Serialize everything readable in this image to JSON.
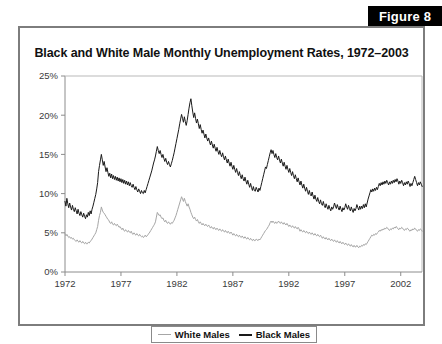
{
  "figure": {
    "badge_label": "Figure 8"
  },
  "chart_title": "Black and White Male Monthly Unemployment Rates, 1972–2003",
  "legend": {
    "items": [
      {
        "label": "White Males",
        "color": "#a6a6a6"
      },
      {
        "label": "Black Males",
        "color": "#1a1a1a"
      }
    ]
  },
  "axes": {
    "y_ticks": [
      "0%",
      "5%",
      "10%",
      "15%",
      "20%",
      "25%"
    ],
    "x_ticks": [
      "1972",
      "1977",
      "1982",
      "1987",
      "1992",
      "1997",
      "2002"
    ]
  },
  "chart_data": {
    "type": "line",
    "title": "Black and White Male Monthly Unemployment Rates, 1972–2003",
    "xlabel": "",
    "ylabel": "",
    "xlim": [
      1972,
      2003.9
    ],
    "ylim": [
      0,
      25
    ],
    "y_unit": "percent",
    "grid": false,
    "legend_position": "bottom",
    "x_tick_values": [
      1972,
      1977,
      1982,
      1987,
      1992,
      1997,
      2002
    ],
    "y_tick_values": [
      0,
      5,
      10,
      15,
      20,
      25
    ],
    "x_start": 1972.0,
    "x_step_years": 0.08333,
    "annotations": [
      "Black male rate peaks near 22% in late 1982/early 1983",
      "White male rate peaks near 10% in late 1982",
      "Both series trough near 1999-2000 and rise through 2003"
    ],
    "series": [
      {
        "name": "White Males",
        "color": "#a6a6a6",
        "values": [
          4.9,
          4.6,
          4.8,
          4.6,
          4.4,
          4.5,
          4.3,
          4.4,
          4.2,
          4.3,
          4.1,
          4.0,
          3.9,
          4.1,
          3.9,
          3.8,
          4.0,
          3.8,
          3.7,
          3.9,
          3.7,
          3.6,
          3.8,
          3.6,
          3.6,
          3.8,
          3.7,
          3.9,
          4.0,
          4.2,
          4.4,
          4.6,
          4.8,
          5.0,
          5.4,
          5.8,
          6.6,
          7.2,
          7.6,
          8.3,
          7.9,
          7.6,
          7.5,
          7.3,
          7.1,
          6.9,
          6.7,
          6.6,
          6.3,
          6.2,
          6.4,
          6.1,
          6.0,
          6.2,
          6.0,
          5.9,
          6.1,
          5.9,
          5.7,
          5.8,
          5.6,
          5.4,
          5.6,
          5.3,
          5.2,
          5.4,
          5.2,
          5.1,
          5.3,
          5.1,
          5.0,
          5.2,
          4.9,
          4.8,
          5.0,
          4.8,
          4.7,
          4.9,
          4.7,
          4.6,
          4.8,
          4.6,
          4.5,
          4.6,
          4.4,
          4.5,
          4.7,
          4.5,
          4.6,
          4.8,
          4.9,
          5.1,
          5.3,
          5.5,
          5.7,
          5.9,
          6.1,
          6.4,
          7.0,
          7.6,
          7.4,
          7.2,
          7.3,
          7.0,
          6.8,
          6.9,
          6.6,
          6.4,
          6.6,
          6.3,
          6.2,
          6.4,
          6.2,
          6.1,
          6.3,
          6.2,
          6.4,
          6.6,
          6.9,
          7.2,
          7.6,
          8.0,
          8.4,
          8.8,
          9.2,
          9.6,
          9.3,
          9.0,
          9.4,
          9.0,
          8.7,
          8.4,
          8.7,
          8.3,
          8.0,
          7.6,
          7.3,
          7.0,
          6.8,
          7.0,
          6.7,
          6.5,
          6.7,
          6.4,
          6.2,
          6.4,
          6.2,
          6.0,
          6.2,
          6.0,
          5.9,
          6.1,
          5.9,
          5.8,
          6.0,
          5.8,
          5.6,
          5.8,
          5.6,
          5.5,
          5.7,
          5.5,
          5.4,
          5.6,
          5.4,
          5.3,
          5.5,
          5.3,
          5.2,
          5.4,
          5.2,
          5.1,
          5.3,
          5.1,
          5.0,
          5.2,
          5.0,
          4.9,
          5.1,
          4.9,
          4.7,
          4.9,
          4.7,
          4.6,
          4.8,
          4.6,
          4.5,
          4.7,
          4.5,
          4.4,
          4.6,
          4.4,
          4.3,
          4.5,
          4.3,
          4.2,
          4.4,
          4.2,
          4.1,
          4.3,
          4.1,
          4.0,
          4.2,
          4.0,
          4.0,
          4.2,
          4.1,
          4.0,
          4.2,
          4.1,
          4.3,
          4.5,
          4.7,
          4.9,
          5.1,
          5.3,
          5.4,
          5.6,
          5.8,
          6.0,
          6.3,
          6.5,
          6.3,
          6.5,
          6.3,
          6.2,
          6.4,
          6.2,
          6.3,
          6.5,
          6.3,
          6.2,
          6.4,
          6.2,
          6.1,
          6.3,
          6.1,
          6.0,
          6.2,
          6.0,
          5.8,
          6.0,
          5.8,
          5.7,
          5.9,
          5.7,
          5.6,
          5.8,
          5.6,
          5.5,
          5.7,
          5.5,
          5.2,
          5.4,
          5.2,
          5.1,
          5.3,
          5.1,
          5.0,
          5.2,
          5.0,
          4.9,
          5.1,
          4.9,
          4.8,
          5.0,
          4.8,
          4.7,
          4.9,
          4.7,
          4.6,
          4.8,
          4.6,
          4.5,
          4.7,
          4.5,
          4.3,
          4.5,
          4.3,
          4.2,
          4.4,
          4.2,
          4.1,
          4.3,
          4.1,
          4.0,
          4.2,
          4.0,
          3.9,
          4.1,
          3.9,
          3.8,
          4.0,
          3.8,
          3.7,
          3.9,
          3.7,
          3.6,
          3.8,
          3.6,
          3.5,
          3.7,
          3.5,
          3.4,
          3.6,
          3.4,
          3.3,
          3.5,
          3.3,
          3.2,
          3.4,
          3.2,
          3.2,
          3.4,
          3.2,
          3.1,
          3.3,
          3.2,
          3.4,
          3.3,
          3.5,
          3.4,
          3.6,
          3.5,
          3.7,
          3.9,
          4.1,
          4.3,
          4.5,
          4.7,
          4.6,
          4.8,
          4.7,
          4.9,
          4.8,
          5.0,
          5.1,
          5.3,
          5.2,
          5.4,
          5.3,
          5.5,
          5.4,
          5.6,
          5.5,
          5.7,
          5.6,
          5.4,
          5.3,
          5.5,
          5.4,
          5.6,
          5.5,
          5.7,
          5.6,
          5.8,
          5.7,
          5.5,
          5.4,
          5.6,
          5.5,
          5.7,
          5.6,
          5.4,
          5.3,
          5.5,
          5.4,
          5.6,
          5.5,
          5.3,
          5.2,
          5.4,
          5.3,
          5.5,
          5.4,
          5.6,
          5.5,
          5.3,
          5.2,
          5.4,
          5.3,
          5.5,
          5.4,
          5.2
        ]
      },
      {
        "name": "Black Males",
        "color": "#1a1a1a",
        "values": [
          9.0,
          8.4,
          9.4,
          8.7,
          8.2,
          8.8,
          8.3,
          7.9,
          8.5,
          8.0,
          7.7,
          8.2,
          7.8,
          7.4,
          8.0,
          7.5,
          7.2,
          7.7,
          7.3,
          7.0,
          7.5,
          7.1,
          6.8,
          7.3,
          7.0,
          7.6,
          7.2,
          7.8,
          7.4,
          8.0,
          8.4,
          8.9,
          9.4,
          9.9,
          10.6,
          11.4,
          12.8,
          13.6,
          14.3,
          15.0,
          14.3,
          13.6,
          14.1,
          13.4,
          12.8,
          13.3,
          12.7,
          12.2,
          12.6,
          12.0,
          12.5,
          11.9,
          12.3,
          11.8,
          12.2,
          11.7,
          12.1,
          11.6,
          12.0,
          11.5,
          11.9,
          11.4,
          11.8,
          11.3,
          11.7,
          11.2,
          11.6,
          11.1,
          11.5,
          11.0,
          11.4,
          11.0,
          10.8,
          11.2,
          10.8,
          10.5,
          10.9,
          10.5,
          10.2,
          10.6,
          10.3,
          10.0,
          10.4,
          10.1,
          10.0,
          10.4,
          10.1,
          10.5,
          10.9,
          11.3,
          11.7,
          12.1,
          12.5,
          12.9,
          13.4,
          13.9,
          14.3,
          14.8,
          15.4,
          16.0,
          15.5,
          15.1,
          15.5,
          15.0,
          14.6,
          15.0,
          14.5,
          14.1,
          14.5,
          14.0,
          13.7,
          14.1,
          13.7,
          13.4,
          13.8,
          14.2,
          14.7,
          15.2,
          15.8,
          16.4,
          17.0,
          17.6,
          18.2,
          18.9,
          19.5,
          20.1,
          19.6,
          19.1,
          19.8,
          19.2,
          18.7,
          19.3,
          20.1,
          20.9,
          21.6,
          22.1,
          21.2,
          20.4,
          19.7,
          20.3,
          19.6,
          19.0,
          19.5,
          18.9,
          18.3,
          18.8,
          18.2,
          17.7,
          18.1,
          17.6,
          17.1,
          17.6,
          17.1,
          16.7,
          17.1,
          16.6,
          16.2,
          16.7,
          16.2,
          15.8,
          16.3,
          15.8,
          15.4,
          15.9,
          15.4,
          15.0,
          15.5,
          15.0,
          14.7,
          15.2,
          14.7,
          14.3,
          14.8,
          14.3,
          13.9,
          14.4,
          13.9,
          13.5,
          14.0,
          13.5,
          13.1,
          13.6,
          13.1,
          12.7,
          13.2,
          12.7,
          12.3,
          12.8,
          12.3,
          11.9,
          12.4,
          11.9,
          11.6,
          12.1,
          11.6,
          11.2,
          11.7,
          11.2,
          10.8,
          11.3,
          10.8,
          10.4,
          10.9,
          10.4,
          10.3,
          10.8,
          10.5,
          10.2,
          10.7,
          10.4,
          10.9,
          11.4,
          11.9,
          12.4,
          12.9,
          13.4,
          13.2,
          13.7,
          14.2,
          14.7,
          15.2,
          15.6,
          15.1,
          15.5,
          15.0,
          14.6,
          15.1,
          14.6,
          14.3,
          14.8,
          14.3,
          13.9,
          14.4,
          13.9,
          13.5,
          14.0,
          13.5,
          13.1,
          13.6,
          13.1,
          12.7,
          13.2,
          12.7,
          12.3,
          12.8,
          12.3,
          11.9,
          12.4,
          11.9,
          11.5,
          12.0,
          11.5,
          11.1,
          11.6,
          11.1,
          10.7,
          11.2,
          10.7,
          10.3,
          10.8,
          10.3,
          9.9,
          10.4,
          9.9,
          9.7,
          10.2,
          9.7,
          9.3,
          9.8,
          9.3,
          9.0,
          9.5,
          9.0,
          8.7,
          9.2,
          8.7,
          8.5,
          9.0,
          8.5,
          8.2,
          8.7,
          8.3,
          8.0,
          8.5,
          8.1,
          7.8,
          8.3,
          8.0,
          8.3,
          8.8,
          8.4,
          8.1,
          8.6,
          8.2,
          7.9,
          8.4,
          8.0,
          7.7,
          8.2,
          7.9,
          8.2,
          8.7,
          8.3,
          8.0,
          8.5,
          8.1,
          7.8,
          8.3,
          7.9,
          7.6,
          8.1,
          7.8,
          8.1,
          8.6,
          8.2,
          7.9,
          8.4,
          8.0,
          8.4,
          8.1,
          8.6,
          8.2,
          8.7,
          8.3,
          8.8,
          9.3,
          9.7,
          10.1,
          10.5,
          10.2,
          10.6,
          10.3,
          10.7,
          10.4,
          10.8,
          10.5,
          10.9,
          11.3,
          11.0,
          11.4,
          11.1,
          11.5,
          11.2,
          11.6,
          11.3,
          11.7,
          11.4,
          11.1,
          11.5,
          11.2,
          11.6,
          11.3,
          11.7,
          11.4,
          11.8,
          11.5,
          11.9,
          11.6,
          11.2,
          11.6,
          11.3,
          11.7,
          11.4,
          11.0,
          11.4,
          11.1,
          11.5,
          11.2,
          11.6,
          11.3,
          10.9,
          11.3,
          11.0,
          11.4,
          11.8,
          12.2,
          11.8,
          11.4,
          11.0,
          11.4,
          11.1,
          11.5,
          11.2,
          10.9
        ]
      }
    ]
  }
}
